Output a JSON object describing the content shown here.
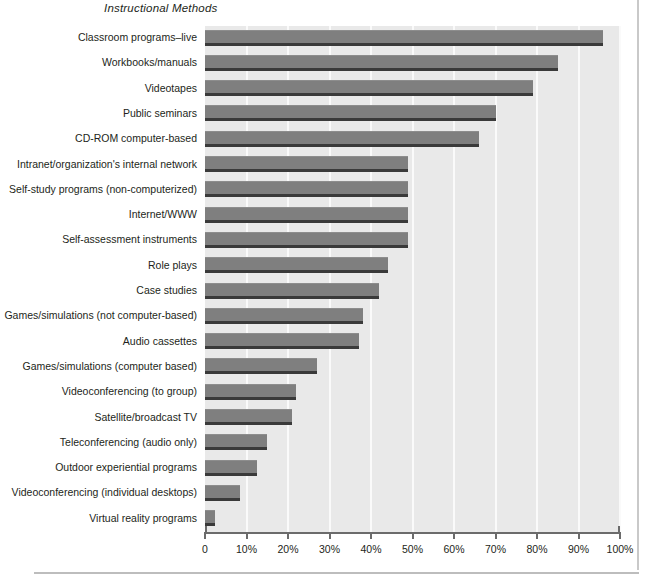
{
  "chart_data": {
    "type": "bar",
    "orientation": "horizontal",
    "title": "Instructional Methods",
    "xlabel": "",
    "ylabel": "",
    "xlim": [
      0,
      100
    ],
    "grid": true,
    "legend": "none",
    "xticks": [
      "0",
      "10%",
      "20%",
      "30%",
      "40%",
      "50%",
      "60%",
      "70%",
      "80%",
      "90%",
      "100%"
    ],
    "xtick_values": [
      0,
      10,
      20,
      30,
      40,
      50,
      60,
      70,
      80,
      90,
      100
    ],
    "categories": [
      "Classroom programs–live",
      "Workbooks/manuals",
      "Videotapes",
      "Public seminars",
      "CD-ROM computer-based",
      "Intranet/organization's internal network",
      "Self-study programs (non-computerized)",
      "Internet/WWW",
      "Self-assessment instruments",
      "Role plays",
      "Case studies",
      "Games/simulations (not computer-based)",
      "Audio cassettes",
      "Games/simulations (computer based)",
      "Videoconferencing (to group)",
      "Satellite/broadcast TV",
      "Teleconferencing (audio only)",
      "Outdoor experiential programs",
      "Videoconferencing (individual desktops)",
      "Virtual reality programs"
    ],
    "values": [
      96,
      85,
      79,
      70,
      66,
      49,
      49,
      49,
      49,
      44,
      42,
      38,
      37,
      27,
      22,
      21,
      15,
      12.5,
      8.5,
      2.5
    ]
  },
  "colors": {
    "bar": "#7f7f7f",
    "bar_shadow": "#3a3a3a",
    "plot_background": "#e9e9e9",
    "gridline": "#fafafa",
    "axis": "#6b6b6b",
    "text": "#231f20",
    "page_rule": "#c9c9c9"
  }
}
